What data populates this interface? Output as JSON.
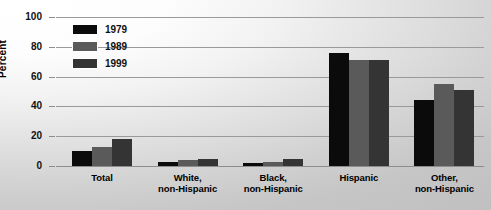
{
  "chart_data": {
    "type": "bar",
    "title": "",
    "xlabel": "",
    "ylabel": "Percent",
    "ylim": [
      0,
      100
    ],
    "yticks": [
      0,
      20,
      40,
      60,
      80,
      100
    ],
    "grid": true,
    "legend_position": "top-left",
    "categories": [
      "Total",
      "White,\nnon-Hispanic",
      "Black,\nnon-Hispanic",
      "Hispanic",
      "Other,\nnon-Hispanic"
    ],
    "category_lines": [
      [
        "Total",
        ""
      ],
      [
        "White,",
        "non-Hispanic"
      ],
      [
        "Black,",
        "non-Hispanic"
      ],
      [
        "Hispanic",
        ""
      ],
      [
        "Other,",
        "non-Hispanic"
      ]
    ],
    "series": [
      {
        "name": "1979",
        "color": "#0b0b0b",
        "values": [
          10,
          3,
          2,
          76,
          44
        ]
      },
      {
        "name": "1989",
        "color": "#5a5a5a",
        "values": [
          13,
          4,
          3,
          71,
          55
        ]
      },
      {
        "name": "1999",
        "color": "#343434",
        "values": [
          18,
          5,
          5,
          71,
          51
        ]
      }
    ]
  },
  "axis": {
    "y_tick_labels": [
      "0",
      "20",
      "40",
      "60",
      "80",
      "100"
    ],
    "y_axis_title": "Percent"
  },
  "legend": {
    "entries": [
      {
        "label": "1979",
        "swatch": "#0b0b0b"
      },
      {
        "label": "1989",
        "swatch": "#5a5a5a"
      },
      {
        "label": "1999",
        "swatch": "#343434"
      }
    ]
  }
}
